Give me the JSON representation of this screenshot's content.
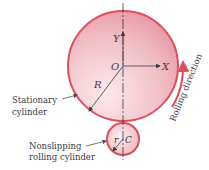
{
  "diagram": {
    "axis_labels": {
      "y": "Y",
      "x": "X",
      "origin": "O"
    },
    "radius_labels": {
      "large": "R",
      "small": "r",
      "center_small": "C"
    },
    "callouts": {
      "stationary": [
        "Stationary",
        "cylinder"
      ],
      "rolling": [
        "Nonslipping",
        "rolling cylinder"
      ]
    },
    "direction_label": "Rolling direction",
    "colors": {
      "cylinder_rim": "#d9505e",
      "cylinder_fill": "#f3c6cc",
      "arrow": "#d9505e",
      "text": "#3a3a4a"
    }
  }
}
